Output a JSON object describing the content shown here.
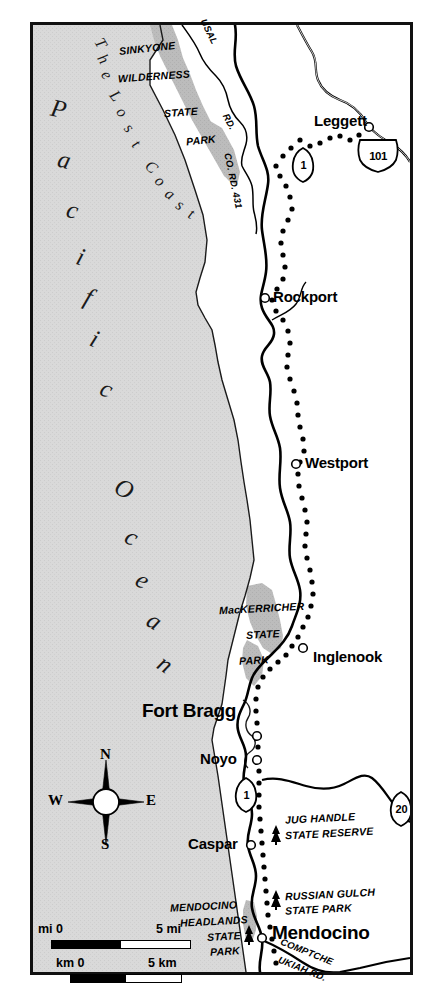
{
  "map": {
    "title": "Mendocino Coast / Lost Coast, California",
    "frame": {
      "border_color": "#111111"
    },
    "colors": {
      "ocean_fill": "#d7d7d7",
      "land_fill": "#ffffff",
      "park_fill": "#b9b9b9",
      "coastline": "#000000",
      "road": "#000000",
      "scenic_trail_dots": "#000000",
      "frame": "#111111"
    },
    "water_labels": [
      {
        "name": "pacific",
        "text": "Pacific"
      },
      {
        "name": "ocean",
        "text": "Ocean"
      }
    ],
    "region_label": {
      "name": "the-lost-coast",
      "text": "The Lost Coast"
    },
    "cities": [
      {
        "name": "leggett",
        "label": "Leggett",
        "x": 318,
        "y": 123,
        "size": "normal",
        "dot": false
      },
      {
        "name": "rockport",
        "label": "Rockport",
        "x": 277,
        "y": 298,
        "size": "normal",
        "dot": true
      },
      {
        "name": "westport",
        "label": "Westport",
        "x": 308,
        "y": 464,
        "size": "normal",
        "dot": true
      },
      {
        "name": "inglenook",
        "label": "Inglenook",
        "x": 315,
        "y": 659,
        "size": "normal",
        "dot": true
      },
      {
        "name": "fort-bragg",
        "label": "Fort Bragg",
        "x": 236,
        "y": 710,
        "size": "big",
        "dot": true
      },
      {
        "name": "noyo",
        "label": "Noyo",
        "x": 205,
        "y": 757,
        "size": "normal",
        "dot": true
      },
      {
        "name": "caspar",
        "label": "Caspar",
        "x": 190,
        "y": 844,
        "size": "normal",
        "dot": true
      },
      {
        "name": "mendocino",
        "label": "Mendocino",
        "x": 265,
        "y": 930,
        "size": "big",
        "dot": true
      }
    ],
    "parks": [
      {
        "name": "sinkyone-wilderness-state-park",
        "lines": [
          "SINKYONE",
          "WILDERNESS",
          "STATE",
          "PARK"
        ]
      },
      {
        "name": "mackerricher-state-park",
        "lines": [
          "MacKERRICHER",
          "STATE",
          "PARK"
        ]
      },
      {
        "name": "jug-handle-state-reserve",
        "lines": [
          "JUG HANDLE",
          "STATE RESERVE"
        ]
      },
      {
        "name": "russian-gulch-state-park",
        "lines": [
          "RUSSIAN GULCH",
          "STATE PARK"
        ]
      },
      {
        "name": "mendocino-headlands-state-park",
        "lines": [
          "MENDOCINO",
          "HEADLANDS",
          "STATE",
          "PARK"
        ]
      }
    ],
    "roads": [
      {
        "name": "usal-road",
        "text": "USAL"
      },
      {
        "name": "usal-road-rd",
        "text": "RD."
      },
      {
        "name": "co-rd-431",
        "text": "CO. RD. 431"
      },
      {
        "name": "comptche-ukiah-road-a",
        "text": "COMPTCHE"
      },
      {
        "name": "comptche-ukiah-road-b",
        "text": "UKIAH RD."
      }
    ],
    "shields": [
      {
        "name": "shield-ca-1-north",
        "type": "state",
        "number": "1",
        "x": 303,
        "y": 161
      },
      {
        "name": "shield-us-101",
        "type": "us",
        "number": "101",
        "x": 377,
        "y": 152
      },
      {
        "name": "shield-ca-1-south",
        "type": "state",
        "number": "1",
        "x": 246,
        "y": 791
      },
      {
        "name": "shield-ca-20",
        "type": "state",
        "number": "20",
        "x": 401,
        "y": 806
      }
    ],
    "compass": {
      "name": "compass-rose",
      "north": "N",
      "east": "E",
      "south": "S",
      "west": "W"
    },
    "scale": {
      "name": "scale-bar",
      "miles": {
        "left_label": "mi 0",
        "right_label": "5 mi"
      },
      "kilometers": {
        "left_label": "km 0",
        "right_label": "5 km"
      }
    }
  }
}
